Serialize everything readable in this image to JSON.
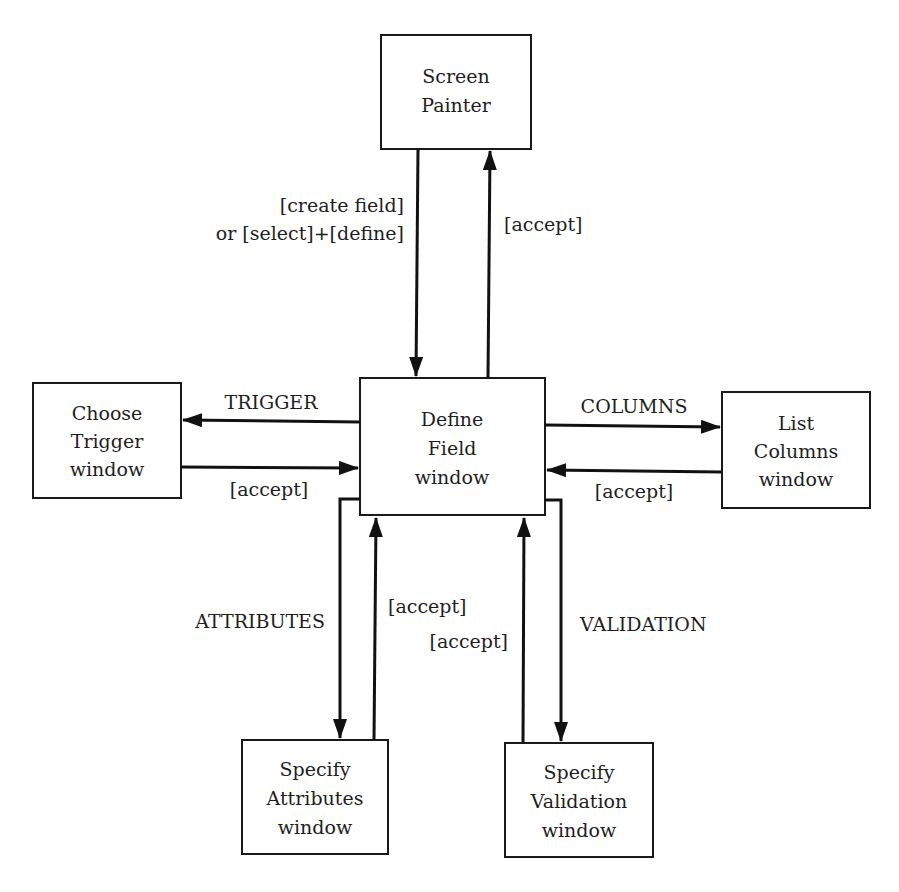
{
  "diagram": {
    "type": "state-transition",
    "nodes": {
      "screen_painter": {
        "lines": [
          "Screen",
          "Painter"
        ]
      },
      "define_field": {
        "lines": [
          "Define",
          "Field",
          "window"
        ]
      },
      "choose_trigger": {
        "lines": [
          "Choose",
          "Trigger",
          "window"
        ]
      },
      "list_columns": {
        "lines": [
          "List",
          "Columns",
          "window"
        ]
      },
      "specify_attributes": {
        "lines": [
          "Specify",
          "Attributes",
          "window"
        ]
      },
      "specify_validation": {
        "lines": [
          "Specify",
          "Validation",
          "window"
        ]
      }
    },
    "edges": {
      "painter_to_define": {
        "from": "Screen Painter",
        "to": "Define Field window",
        "label_lines": [
          "[create field]",
          "or [select]+[define]"
        ]
      },
      "define_to_painter": {
        "from": "Define Field window",
        "to": "Screen Painter",
        "label": "[accept]"
      },
      "define_to_trigger": {
        "from": "Define Field window",
        "to": "Choose Trigger window",
        "label": "TRIGGER"
      },
      "trigger_to_define": {
        "from": "Choose Trigger window",
        "to": "Define Field window",
        "label": "[accept]"
      },
      "define_to_columns": {
        "from": "Define Field window",
        "to": "List Columns window",
        "label": "COLUMNS"
      },
      "columns_to_define": {
        "from": "List Columns window",
        "to": "Define Field window",
        "label": "[accept]"
      },
      "define_to_attributes": {
        "from": "Define Field window",
        "to": "Specify Attributes window",
        "label": "ATTRIBUTES"
      },
      "attributes_to_define": {
        "from": "Specify Attributes window",
        "to": "Define Field window",
        "label": "[accept]"
      },
      "validation_to_define": {
        "from": "Specify Validation window",
        "to": "Define Field window",
        "label": "[accept]"
      },
      "define_to_validation": {
        "from": "Define Field window",
        "to": "Specify Validation window",
        "label": "VALIDATION"
      }
    },
    "colors": {
      "ink": "#111111",
      "background": "#ffffff"
    }
  }
}
